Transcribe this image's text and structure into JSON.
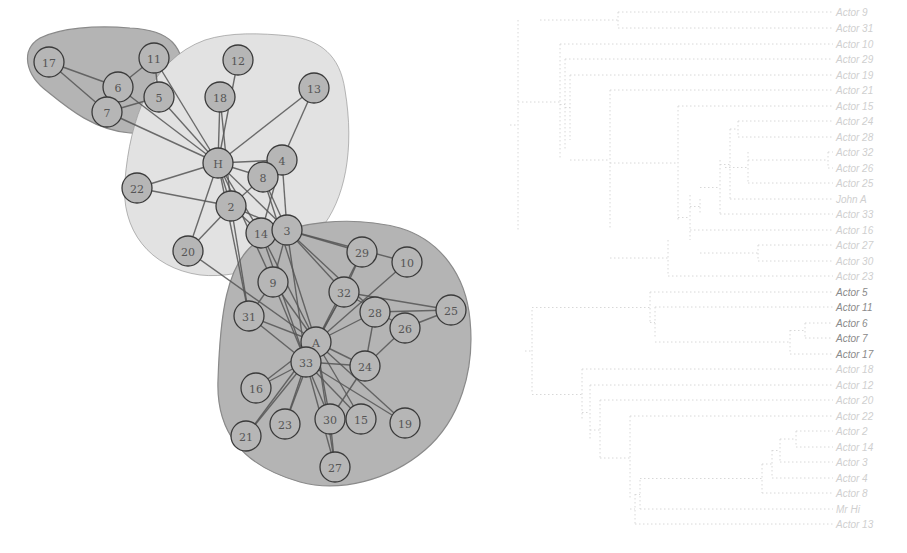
{
  "colors": {
    "hull_dark": "#b4b4b4",
    "hull_light": "#e2e2e2",
    "hull_stroke": "#8a8a8a",
    "node_fill": "#b6b6b6",
    "node_stroke": "#3a3a3a",
    "edge": "#555555",
    "dendro_line": "#d8d8d8",
    "leaf_faint": "#cfcfcf",
    "leaf_dark": "#8a8a8a"
  },
  "network": {
    "hulls": [
      {
        "id": "cluster-top-left",
        "shade": "dark",
        "path": "M 40 38 C 20 50, 25 75, 48 92 C 70 110, 95 130, 130 133 C 160 135, 185 115, 185 85 C 185 45, 170 30, 130 28 C 95 25, 60 28, 40 38 Z"
      },
      {
        "id": "cluster-hi",
        "shade": "light",
        "path": "M 205 40 C 150 60, 130 120, 125 180 C 120 230, 150 268, 200 275 C 245 280, 300 255, 320 230 C 345 200, 355 150, 345 90 C 340 55, 320 40, 290 36 C 260 33, 230 32, 205 40 Z"
      },
      {
        "id": "cluster-a",
        "shade": "dark",
        "path": "M 260 240 C 225 260, 220 320, 218 380 C 216 430, 240 465, 300 482 C 340 493, 390 480, 425 450 C 460 420, 475 370, 470 320 C 466 275, 440 240, 400 228 C 350 215, 295 222, 260 240 Z"
      }
    ],
    "nodes": [
      {
        "id": "17",
        "x": 49,
        "y": 62
      },
      {
        "id": "6",
        "x": 118,
        "y": 87
      },
      {
        "id": "11",
        "x": 154,
        "y": 58
      },
      {
        "id": "5",
        "x": 159,
        "y": 97
      },
      {
        "id": "7",
        "x": 107,
        "y": 112
      },
      {
        "id": "12",
        "x": 238,
        "y": 60
      },
      {
        "id": "18",
        "x": 220,
        "y": 97
      },
      {
        "id": "13",
        "x": 314,
        "y": 88
      },
      {
        "id": "H",
        "x": 218,
        "y": 163
      },
      {
        "id": "4",
        "x": 282,
        "y": 160
      },
      {
        "id": "8",
        "x": 263,
        "y": 177
      },
      {
        "id": "22",
        "x": 137,
        "y": 188
      },
      {
        "id": "2",
        "x": 231,
        "y": 206
      },
      {
        "id": "14",
        "x": 261,
        "y": 233
      },
      {
        "id": "3",
        "x": 287,
        "y": 230
      },
      {
        "id": "20",
        "x": 188,
        "y": 251
      },
      {
        "id": "29",
        "x": 362,
        "y": 252
      },
      {
        "id": "10",
        "x": 407,
        "y": 262
      },
      {
        "id": "9",
        "x": 273,
        "y": 282
      },
      {
        "id": "32",
        "x": 344,
        "y": 292
      },
      {
        "id": "28",
        "x": 375,
        "y": 312
      },
      {
        "id": "25",
        "x": 451,
        "y": 310
      },
      {
        "id": "26",
        "x": 405,
        "y": 328
      },
      {
        "id": "31",
        "x": 249,
        "y": 316
      },
      {
        "id": "A",
        "x": 316,
        "y": 342
      },
      {
        "id": "33",
        "x": 306,
        "y": 362
      },
      {
        "id": "24",
        "x": 365,
        "y": 366
      },
      {
        "id": "16",
        "x": 256,
        "y": 388
      },
      {
        "id": "23",
        "x": 285,
        "y": 424
      },
      {
        "id": "30",
        "x": 330,
        "y": 419
      },
      {
        "id": "15",
        "x": 361,
        "y": 419
      },
      {
        "id": "19",
        "x": 405,
        "y": 423
      },
      {
        "id": "21",
        "x": 246,
        "y": 436
      },
      {
        "id": "27",
        "x": 335,
        "y": 467
      }
    ],
    "edges": [
      [
        "17",
        "6"
      ],
      [
        "17",
        "7"
      ],
      [
        "6",
        "11"
      ],
      [
        "6",
        "7"
      ],
      [
        "11",
        "5"
      ],
      [
        "5",
        "7"
      ],
      [
        "11",
        "H"
      ],
      [
        "5",
        "H"
      ],
      [
        "6",
        "H"
      ],
      [
        "7",
        "H"
      ],
      [
        "12",
        "H"
      ],
      [
        "18",
        "H"
      ],
      [
        "18",
        "2"
      ],
      [
        "13",
        "H"
      ],
      [
        "13",
        "4"
      ],
      [
        "H",
        "4"
      ],
      [
        "H",
        "8"
      ],
      [
        "H",
        "22"
      ],
      [
        "H",
        "2"
      ],
      [
        "H",
        "14"
      ],
      [
        "H",
        "3"
      ],
      [
        "H",
        "20"
      ],
      [
        "H",
        "9"
      ],
      [
        "H",
        "31"
      ],
      [
        "22",
        "2"
      ],
      [
        "2",
        "20"
      ],
      [
        "2",
        "8"
      ],
      [
        "2",
        "14"
      ],
      [
        "2",
        "3"
      ],
      [
        "2",
        "31"
      ],
      [
        "4",
        "8"
      ],
      [
        "4",
        "3"
      ],
      [
        "4",
        "14"
      ],
      [
        "8",
        "3"
      ],
      [
        "8",
        "A"
      ],
      [
        "14",
        "33"
      ],
      [
        "14",
        "A"
      ],
      [
        "14",
        "3"
      ],
      [
        "3",
        "9"
      ],
      [
        "3",
        "10"
      ],
      [
        "3",
        "28"
      ],
      [
        "3",
        "29"
      ],
      [
        "3",
        "33"
      ],
      [
        "3",
        "32"
      ],
      [
        "20",
        "A"
      ],
      [
        "29",
        "32"
      ],
      [
        "29",
        "A"
      ],
      [
        "10",
        "A"
      ],
      [
        "9",
        "31"
      ],
      [
        "9",
        "A"
      ],
      [
        "9",
        "33"
      ],
      [
        "32",
        "A"
      ],
      [
        "32",
        "33"
      ],
      [
        "32",
        "25"
      ],
      [
        "32",
        "26"
      ],
      [
        "28",
        "25"
      ],
      [
        "28",
        "A"
      ],
      [
        "28",
        "24"
      ],
      [
        "25",
        "26"
      ],
      [
        "26",
        "24"
      ],
      [
        "31",
        "A"
      ],
      [
        "31",
        "33"
      ],
      [
        "A",
        "33"
      ],
      [
        "A",
        "24"
      ],
      [
        "A",
        "15"
      ],
      [
        "A",
        "19"
      ],
      [
        "A",
        "30"
      ],
      [
        "A",
        "16"
      ],
      [
        "A",
        "21"
      ],
      [
        "A",
        "23"
      ],
      [
        "A",
        "27"
      ],
      [
        "33",
        "24"
      ],
      [
        "33",
        "16"
      ],
      [
        "33",
        "23"
      ],
      [
        "33",
        "21"
      ],
      [
        "33",
        "30"
      ],
      [
        "33",
        "15"
      ],
      [
        "33",
        "19"
      ],
      [
        "33",
        "27"
      ],
      [
        "24",
        "30"
      ],
      [
        "30",
        "27"
      ]
    ]
  },
  "dendrogram": {
    "leaves": [
      {
        "label": "Actor 9",
        "y": 12,
        "dark": false
      },
      {
        "label": "Actor 31",
        "y": 28,
        "dark": false
      },
      {
        "label": "Actor 10",
        "y": 44,
        "dark": false
      },
      {
        "label": "Actor 29",
        "y": 59,
        "dark": false
      },
      {
        "label": "Actor 19",
        "y": 75,
        "dark": false
      },
      {
        "label": "Actor 21",
        "y": 90,
        "dark": false
      },
      {
        "label": "Actor 15",
        "y": 106,
        "dark": false
      },
      {
        "label": "Actor 24",
        "y": 121,
        "dark": false
      },
      {
        "label": "Actor 28",
        "y": 137,
        "dark": false
      },
      {
        "label": "Actor 32",
        "y": 152,
        "dark": false
      },
      {
        "label": "Actor 26",
        "y": 168,
        "dark": false
      },
      {
        "label": "Actor 25",
        "y": 183,
        "dark": false
      },
      {
        "label": "John A",
        "y": 199,
        "dark": false
      },
      {
        "label": "Actor 33",
        "y": 214,
        "dark": false
      },
      {
        "label": "Actor 16",
        "y": 230,
        "dark": false
      },
      {
        "label": "Actor 27",
        "y": 245,
        "dark": false
      },
      {
        "label": "Actor 30",
        "y": 261,
        "dark": false
      },
      {
        "label": "Actor 23",
        "y": 276,
        "dark": false
      },
      {
        "label": "Actor 5",
        "y": 292,
        "dark": true
      },
      {
        "label": "Actor 11",
        "y": 307,
        "dark": true
      },
      {
        "label": "Actor 6",
        "y": 323,
        "dark": true
      },
      {
        "label": "Actor 7",
        "y": 338,
        "dark": true
      },
      {
        "label": "Actor 17",
        "y": 354,
        "dark": true
      },
      {
        "label": "Actor 18",
        "y": 369,
        "dark": false
      },
      {
        "label": "Actor 12",
        "y": 385,
        "dark": false
      },
      {
        "label": "Actor 20",
        "y": 400,
        "dark": false
      },
      {
        "label": "Actor 22",
        "y": 416,
        "dark": false
      },
      {
        "label": "Actor 2",
        "y": 431,
        "dark": false
      },
      {
        "label": "Actor 14",
        "y": 447,
        "dark": false
      },
      {
        "label": "Actor 3",
        "y": 462,
        "dark": false
      },
      {
        "label": "Actor 4",
        "y": 478,
        "dark": false
      },
      {
        "label": "Actor 8",
        "y": 493,
        "dark": false
      },
      {
        "label": "Mr Hi",
        "y": 509,
        "dark": false
      },
      {
        "label": "Actor 13",
        "y": 524,
        "dark": false
      }
    ],
    "leaf_x": 335,
    "links": [
      {
        "x": 118,
        "y1": 12,
        "y2": 28,
        "px": 40
      },
      {
        "x": 18,
        "y1": 20,
        "y2": 230,
        "px": 10
      },
      {
        "x": 60,
        "y1": 44,
        "y2": 160,
        "px": 18
      },
      {
        "x": 65,
        "y1": 59,
        "y2": 150,
        "px": 60
      },
      {
        "x": 70,
        "y1": 75,
        "y2": 140,
        "px": 65
      },
      {
        "x": 110,
        "y1": 90,
        "y2": 230,
        "px": 70
      },
      {
        "x": 178,
        "y1": 106,
        "y2": 220,
        "px": 110
      },
      {
        "x": 238,
        "y1": 121,
        "y2": 137,
        "px": 230
      },
      {
        "x": 230,
        "y1": 129,
        "y2": 200,
        "px": 220
      },
      {
        "x": 248,
        "y1": 152,
        "y2": 183,
        "px": 225
      },
      {
        "x": 328,
        "y1": 152,
        "y2": 168,
        "px": 248
      },
      {
        "x": 220,
        "y1": 160,
        "y2": 215,
        "px": 200
      },
      {
        "x": 200,
        "y1": 199,
        "y2": 214,
        "px": 190
      },
      {
        "x": 190,
        "y1": 195,
        "y2": 240,
        "px": 178
      },
      {
        "x": 258,
        "y1": 245,
        "y2": 261,
        "px": 200
      },
      {
        "x": 168,
        "y1": 240,
        "y2": 276,
        "px": 110
      },
      {
        "x": 150,
        "y1": 292,
        "y2": 323,
        "px": 32
      },
      {
        "x": 155,
        "y1": 307,
        "y2": 338,
        "px": 150
      },
      {
        "x": 305,
        "y1": 323,
        "y2": 338,
        "px": 290
      },
      {
        "x": 290,
        "y1": 330,
        "y2": 354,
        "px": 155
      },
      {
        "x": 32,
        "y1": 310,
        "y2": 392,
        "px": 25
      },
      {
        "x": 82,
        "y1": 369,
        "y2": 420,
        "px": 32
      },
      {
        "x": 90,
        "y1": 385,
        "y2": 440,
        "px": 82
      },
      {
        "x": 100,
        "y1": 400,
        "y2": 460,
        "px": 90
      },
      {
        "x": 130,
        "y1": 416,
        "y2": 500,
        "px": 100
      },
      {
        "x": 296,
        "y1": 431,
        "y2": 447,
        "px": 280
      },
      {
        "x": 280,
        "y1": 439,
        "y2": 462,
        "px": 272
      },
      {
        "x": 272,
        "y1": 450,
        "y2": 478,
        "px": 262
      },
      {
        "x": 262,
        "y1": 464,
        "y2": 493,
        "px": 140
      },
      {
        "x": 140,
        "y1": 480,
        "y2": 509,
        "px": 135
      },
      {
        "x": 135,
        "y1": 494,
        "y2": 524,
        "px": 130
      }
    ]
  }
}
